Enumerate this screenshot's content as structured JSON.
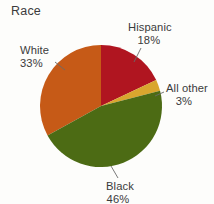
{
  "chart_data": {
    "type": "pie",
    "title": "Race",
    "xlabel": "",
    "ylabel": "",
    "legend": "none",
    "grid": false,
    "labels_inline": true,
    "categories": [
      "Hispanic",
      "All other",
      "Black",
      "White"
    ],
    "values": [
      18,
      3,
      46,
      33
    ],
    "value_suffix": "%",
    "colors": [
      "#B01520",
      "#D9A62E",
      "#4C6B14",
      "#C65A17"
    ],
    "slices": [
      {
        "name": "Hispanic",
        "label": "Hispanic",
        "percent_text": "18%",
        "value": 18,
        "color": "#B01520",
        "start_angle": 0,
        "end_angle": 64.8
      },
      {
        "name": "All other",
        "label": "All other",
        "percent_text": "3%",
        "value": 3,
        "color": "#D9A62E",
        "start_angle": 64.8,
        "end_angle": 75.6
      },
      {
        "name": "Black",
        "label": "Black",
        "percent_text": "46%",
        "value": 46,
        "color": "#4C6B14",
        "start_angle": 75.6,
        "end_angle": 241.2
      },
      {
        "name": "White",
        "label": "White",
        "percent_text": "33%",
        "value": 33,
        "color": "#C65A17",
        "start_angle": 241.2,
        "end_angle": 360
      }
    ]
  },
  "figure": {
    "title": "Race",
    "background": "#fdfdfb",
    "text_color": "#3b3b3b"
  }
}
